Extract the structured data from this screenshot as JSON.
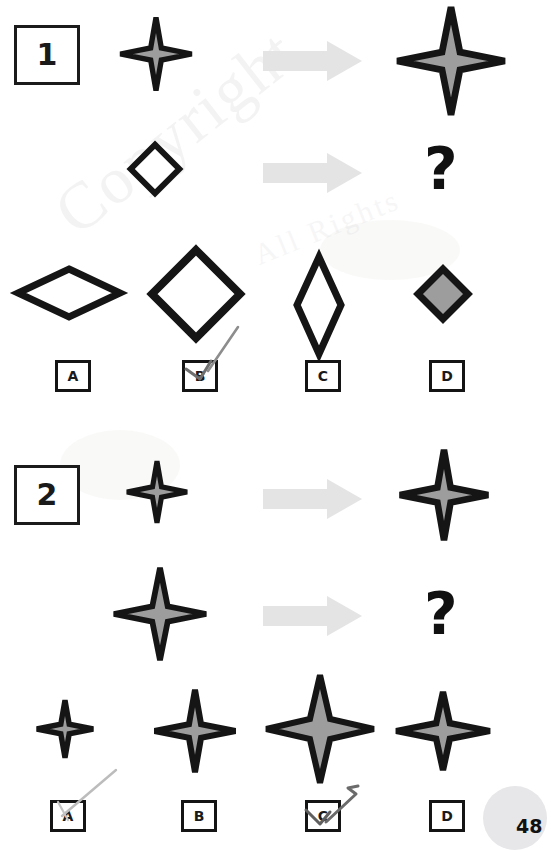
{
  "document": {
    "type": "reasoning-test-worksheet",
    "page_number": "48",
    "watermark_text": "Copyright",
    "watermark_text_2": "All Rights",
    "question_mark_glyph": "?",
    "arrow_color": "#e3e3e3",
    "ink_color": "#141414",
    "star_fill_color": "#9d9d9d",
    "pencil_color": "#8a8a8a"
  },
  "questions": [
    {
      "number": "1",
      "prompt_row": {
        "source_name": "small-star",
        "arrow_name": "transform-arrow",
        "result_name": "large-star"
      },
      "query_row": {
        "source_name": "small-diamond",
        "arrow_name": "transform-arrow",
        "result_name": "question-mark"
      },
      "options": [
        {
          "letter": "A",
          "shape": "wide-flat-diamond-outline",
          "selected": false
        },
        {
          "letter": "B",
          "shape": "large-square-diamond-outline",
          "selected": true
        },
        {
          "letter": "C",
          "shape": "tall-narrow-diamond-outline",
          "selected": false
        },
        {
          "letter": "D",
          "shape": "small-filled-diamond",
          "selected": false
        }
      ],
      "marked_answer": "B"
    },
    {
      "number": "2",
      "prompt_row": {
        "source_name": "small-star",
        "arrow_name": "transform-arrow",
        "result_name": "medium-star"
      },
      "query_row": {
        "source_name": "medium-star",
        "arrow_name": "transform-arrow",
        "result_name": "question-mark"
      },
      "options": [
        {
          "letter": "A",
          "shape": "very-small-star",
          "selected": false
        },
        {
          "letter": "B",
          "shape": "medium-tall-star",
          "selected": false
        },
        {
          "letter": "C",
          "shape": "large-star",
          "selected": true
        },
        {
          "letter": "D",
          "shape": "medium-wide-star",
          "selected": false
        }
      ],
      "marked_answer": "C"
    }
  ]
}
